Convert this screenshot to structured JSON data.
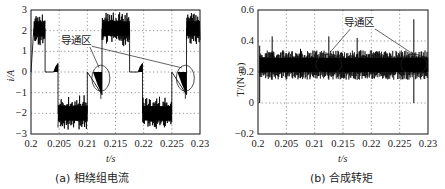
{
  "chart_data": [
    {
      "type": "line",
      "title": "",
      "caption": "(a) 相绕组电流",
      "xlabel": "t/s",
      "ylabel": "i/A",
      "xlim": [
        0.2,
        0.23
      ],
      "ylim": [
        -3,
        3
      ],
      "x_ticks": [
        "0.2",
        "0.205",
        "0.21",
        "0.215",
        "0.22",
        "0.225",
        "0.23"
      ],
      "y_ticks": [
        "3",
        "2",
        "1",
        "0",
        "-1",
        "-2",
        "-3"
      ],
      "grid": true,
      "annotation": "导通区",
      "series": [
        {
          "name": "phase winding current",
          "x": [
            0.2,
            0.2005,
            0.2025,
            0.2025,
            0.204,
            0.2048,
            0.2048,
            0.21,
            0.21,
            0.2112,
            0.2126,
            0.2126,
            0.2175,
            0.2175,
            0.219,
            0.2198,
            0.2198,
            0.225,
            0.225,
            0.2262,
            0.2276,
            0.2276,
            0.23
          ],
          "values": [
            0,
            2.1,
            2.1,
            0,
            0,
            0.4,
            -2,
            -2,
            0,
            -0.5,
            -1.1,
            2.1,
            2.1,
            0,
            0,
            0.4,
            -2,
            -2,
            0,
            -0.5,
            -1.1,
            2.1,
            2.1
          ]
        }
      ],
      "ellipses": [
        {
          "cx": 0.2124,
          "cy": -0.3,
          "label": "导通区"
        },
        {
          "cx": 0.2274,
          "cy": -0.3,
          "label": "导通区"
        }
      ]
    },
    {
      "type": "line",
      "title": "",
      "caption": "(b) 合成转矩",
      "xlabel": "t/s",
      "ylabel": "T/(N·m)",
      "xlim": [
        0.2,
        0.23
      ],
      "ylim": [
        -0.2,
        0.6
      ],
      "x_ticks": [
        "0.2",
        "0.205",
        "0.21",
        "0.215",
        "0.22",
        "0.225",
        "0.23"
      ],
      "y_ticks": [
        "0.6",
        "0.4",
        "0.2",
        "0",
        "-0.2"
      ],
      "grid": true,
      "annotation": "导通区",
      "series": [
        {
          "name": "resultant torque",
          "mean": 0.25,
          "band": [
            0.17,
            0.32
          ],
          "spikes": [
            {
              "x": 0.2003,
              "min": 0.0,
              "max": 0.37
            },
            {
              "x": 0.2025,
              "min": 0.15,
              "max": 0.43
            },
            {
              "x": 0.2075,
              "min": 0.16,
              "max": 0.35
            },
            {
              "x": 0.2125,
              "min": 0.15,
              "max": 0.43
            },
            {
              "x": 0.2175,
              "min": 0.15,
              "max": 0.42
            },
            {
              "x": 0.2275,
              "min": 0.0,
              "max": 0.54
            }
          ]
        }
      ],
      "ellipses": [
        {
          "cx": 0.2125,
          "cy": 0.25,
          "label": "导通区"
        },
        {
          "cx": 0.2275,
          "cy": 0.25,
          "label": "导通区"
        }
      ]
    }
  ]
}
